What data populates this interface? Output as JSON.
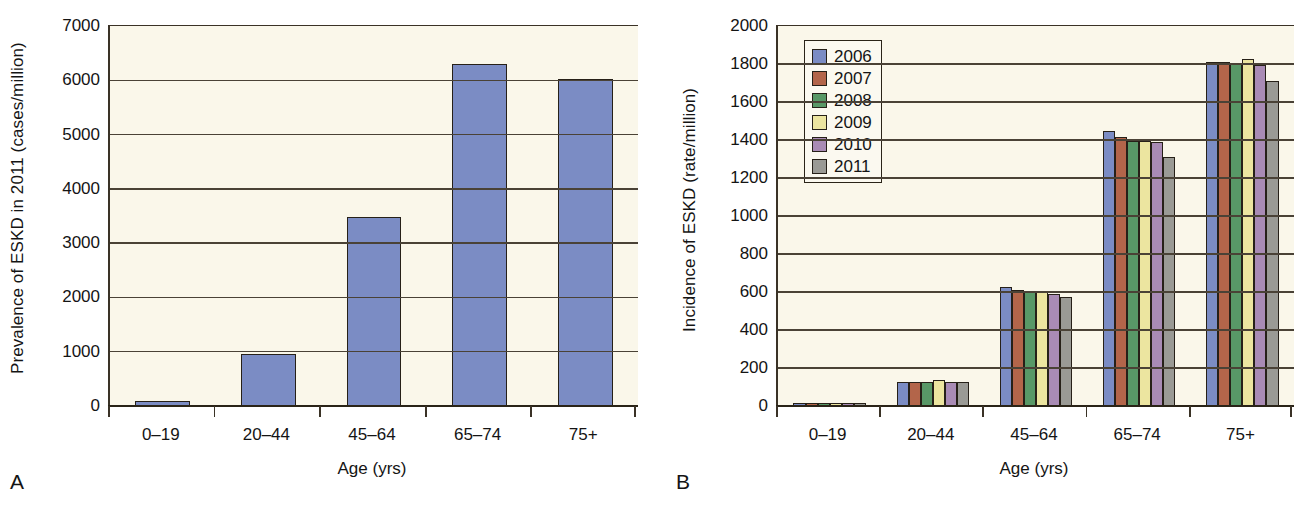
{
  "figure": {
    "panels": [
      {
        "letter": "A",
        "ylabel": "Prevalence of ESKD in 2011 (cases/million)",
        "xlabel": "Age (yrs)"
      },
      {
        "letter": "B",
        "ylabel": "Incidence of ESKD (rate/million)",
        "xlabel": "Age (yrs)"
      }
    ]
  },
  "colors": {
    "plot_background": "#faf7ea",
    "axis": "#3a3226",
    "gridline": "#4a4236",
    "bar_outline": "#262018",
    "panel_a_bar": "#7b8cc4",
    "series_2006": "#7b8cc4",
    "series_2007": "#b3654a",
    "series_2008": "#589867",
    "series_2009": "#ece5a0",
    "series_2010": "#a98bb5",
    "series_2011": "#9a9a95"
  },
  "chart_data": [
    {
      "type": "bar",
      "panel": "A",
      "title": "",
      "xlabel": "Age (yrs)",
      "ylabel": "Prevalence of ESKD in 2011 (cases/million)",
      "categories": [
        "0–19",
        "20–44",
        "45–64",
        "65–74",
        "75+"
      ],
      "values": [
        95,
        965,
        3480,
        6300,
        6025
      ],
      "ylim": [
        0,
        7000
      ],
      "yticks": [
        0,
        1000,
        2000,
        3000,
        4000,
        5000,
        6000,
        7000
      ],
      "ytick_labels": [
        "0",
        "1000",
        "2000",
        "3000",
        "4000",
        "5000",
        "6000",
        "7000"
      ],
      "grid": true,
      "legend": false,
      "bar_color": "#7b8cc4"
    },
    {
      "type": "bar",
      "panel": "B",
      "title": "",
      "xlabel": "Age (yrs)",
      "ylabel": "Incidence of ESKD (rate/million)",
      "categories": [
        "0–19",
        "20–44",
        "45–64",
        "65–74",
        "75+"
      ],
      "ylim": [
        0,
        2000
      ],
      "yticks": [
        0,
        200,
        400,
        600,
        800,
        1000,
        1200,
        1400,
        1600,
        1800,
        2000
      ],
      "ytick_labels": [
        "0",
        "200",
        "400",
        "600",
        "800",
        "1000",
        "1200",
        "1400",
        "1600",
        "1800",
        "2000"
      ],
      "grid": true,
      "legend": true,
      "legend_position": "upper-left",
      "series": [
        {
          "name": "2006",
          "color": "#7b8cc4",
          "values": [
            17,
            127,
            628,
            1445,
            1812
          ]
        },
        {
          "name": "2007",
          "color": "#b3654a",
          "values": [
            16,
            126,
            610,
            1418,
            1810
          ]
        },
        {
          "name": "2008",
          "color": "#589867",
          "values": [
            16,
            127,
            607,
            1396,
            1805
          ]
        },
        {
          "name": "2009",
          "color": "#ece5a0",
          "values": [
            16,
            137,
            603,
            1393,
            1825
          ]
        },
        {
          "name": "2010",
          "color": "#a98bb5",
          "values": [
            15,
            128,
            590,
            1390,
            1797
          ]
        },
        {
          "name": "2011",
          "color": "#9a9a95",
          "values": [
            15,
            124,
            572,
            1308,
            1710
          ]
        }
      ]
    }
  ]
}
